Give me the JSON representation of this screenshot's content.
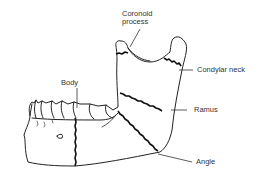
{
  "diagram": {
    "labels": {
      "coronoid_line1": "Coronoid",
      "coronoid_line2": "process",
      "condylar_neck": "Condylar neck",
      "body": "Body",
      "ramus": "Ramus",
      "angle": "Angle"
    },
    "colors": {
      "line": "#222222",
      "text": "#333333",
      "background": "#ffffff"
    }
  }
}
